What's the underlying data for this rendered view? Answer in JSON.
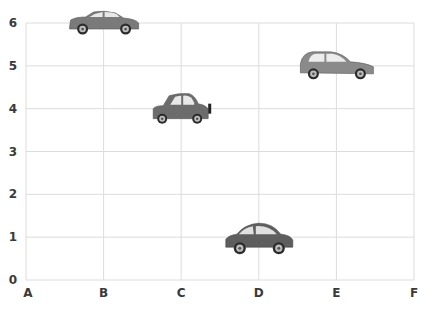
{
  "chart_data": {
    "type": "scatter",
    "title": "",
    "xlabel": "",
    "ylabel": "",
    "categories": [
      "A",
      "B",
      "C",
      "D",
      "E",
      "F"
    ],
    "ylim": [
      0,
      6
    ],
    "yticks": [
      0,
      1,
      2,
      3,
      4,
      5,
      6
    ],
    "grid": true,
    "legend": null,
    "marker": "car-icon",
    "points": [
      {
        "x": "B",
        "y": 6,
        "marker": "sedan-car-icon",
        "color": "#7a7a7a"
      },
      {
        "x": "C",
        "y": 4,
        "marker": "compact-car-icon",
        "color": "#6c6c6c"
      },
      {
        "x": "D",
        "y": 1,
        "marker": "small-car-icon",
        "color": "#5e5e5e"
      },
      {
        "x": "E",
        "y": 5,
        "marker": "hatchback-car-icon",
        "color": "#8a8a8a"
      }
    ]
  },
  "colors": {
    "grid": "#dcdcdc",
    "labels": "#3a3a3a",
    "background": "#ffffff"
  }
}
